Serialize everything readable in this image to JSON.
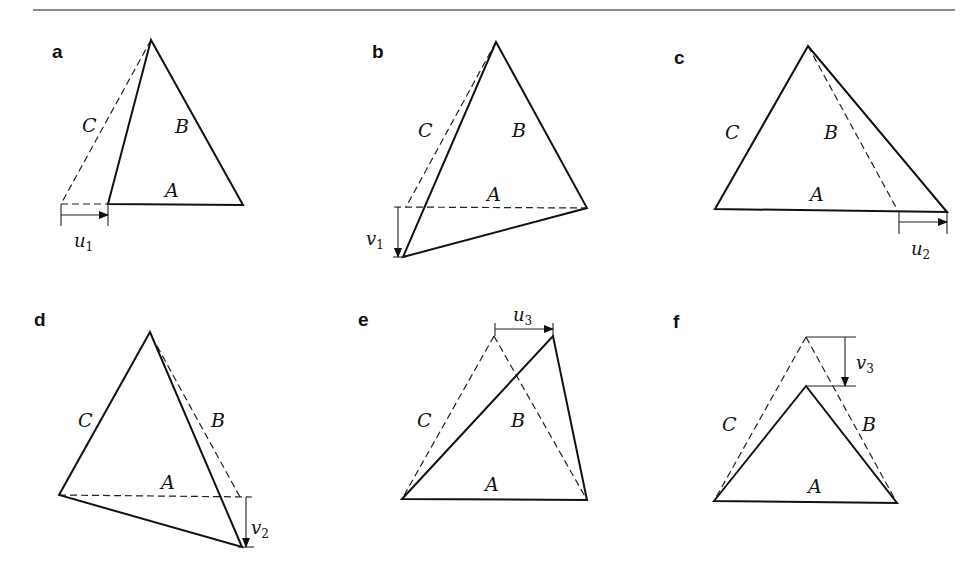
{
  "figure": {
    "rule_color": "#8a8a8a",
    "line_color": "#111111"
  },
  "panels": [
    {
      "id": "a",
      "letter": "a",
      "letter_pos": [
        52,
        58
      ],
      "solid": [
        [
          151,
          40
        ],
        [
          108,
          204
        ],
        [
          243,
          205
        ]
      ],
      "dashed": [
        [
          [
            151,
            40
          ],
          [
            61,
            204
          ]
        ],
        [
          [
            61,
            204
          ],
          [
            108,
            204
          ]
        ]
      ],
      "labels": [
        {
          "text": "C",
          "x": 82,
          "y": 132
        },
        {
          "text": "B",
          "x": 175,
          "y": 133
        },
        {
          "text": "A",
          "x": 165,
          "y": 197
        }
      ],
      "displacement": {
        "name": "u",
        "sub": "1",
        "direction": "horizontal",
        "from": [
          61,
          215
        ],
        "to": [
          108,
          215
        ],
        "ticks": [
          [
            61,
            204,
            61,
            226
          ],
          [
            108,
            204,
            108,
            226
          ]
        ],
        "label_x": 74,
        "label_y": 247
      }
    },
    {
      "id": "b",
      "letter": "b",
      "letter_pos": [
        372,
        58
      ],
      "solid": [
        [
          496,
          42
        ],
        [
          403,
          257
        ],
        [
          587,
          208
        ]
      ],
      "dashed": [
        [
          [
            496,
            42
          ],
          [
            406,
            207
          ]
        ],
        [
          [
            394,
            207
          ],
          [
            587,
            208
          ]
        ]
      ],
      "labels": [
        {
          "text": "C",
          "x": 418,
          "y": 137
        },
        {
          "text": "B",
          "x": 512,
          "y": 137
        },
        {
          "text": "A",
          "x": 487,
          "y": 201
        }
      ],
      "displacement": {
        "name": "v",
        "sub": "1",
        "direction": "vertical",
        "from": [
          398,
          207
        ],
        "to": [
          398,
          257
        ],
        "ticks": [
          [
            393,
            257,
            406,
            257
          ]
        ],
        "label_x": 366,
        "label_y": 245
      }
    },
    {
      "id": "c",
      "letter": "c",
      "letter_pos": [
        674,
        64
      ],
      "solid": [
        [
          808,
          46
        ],
        [
          715,
          209
        ],
        [
          947,
          212
        ]
      ],
      "dashed": [
        [
          [
            808,
            46
          ],
          [
            898,
            211
          ]
        ]
      ],
      "labels": [
        {
          "text": "C",
          "x": 725,
          "y": 139
        },
        {
          "text": "B",
          "x": 824,
          "y": 139
        },
        {
          "text": "A",
          "x": 810,
          "y": 201
        }
      ],
      "displacement": {
        "name": "u",
        "sub": "2",
        "direction": "horizontal",
        "from": [
          899,
          222
        ],
        "to": [
          947,
          222
        ],
        "ticks": [
          [
            899,
            211,
            899,
            234
          ],
          [
            947,
            212,
            947,
            234
          ]
        ],
        "label_x": 911,
        "label_y": 255
      }
    },
    {
      "id": "d",
      "letter": "d",
      "letter_pos": [
        34,
        326
      ],
      "solid": [
        [
          150,
          332
        ],
        [
          59,
          495
        ],
        [
          242,
          547
        ]
      ],
      "dashed": [
        [
          [
            157,
            346
          ],
          [
            240,
            497
          ]
        ],
        [
          [
            59,
            495
          ],
          [
            252,
            497
          ]
        ]
      ],
      "labels": [
        {
          "text": "C",
          "x": 78,
          "y": 427
        },
        {
          "text": "B",
          "x": 211,
          "y": 427
        },
        {
          "text": "A",
          "x": 161,
          "y": 489
        }
      ],
      "displacement": {
        "name": "v",
        "sub": "2",
        "direction": "vertical",
        "from": [
          246,
          497
        ],
        "to": [
          246,
          547
        ],
        "ticks": [
          [
            238,
            547,
            254,
            547
          ]
        ],
        "label_x": 251,
        "label_y": 534
      }
    },
    {
      "id": "e",
      "letter": "e",
      "letter_pos": [
        358,
        326
      ],
      "solid": [
        [
          402,
          499
        ],
        [
          553,
          336
        ],
        [
          587,
          500
        ]
      ],
      "dashed": [
        [
          [
            494,
            336
          ],
          [
            402,
            499
          ]
        ],
        [
          [
            494,
            336
          ],
          [
            587,
            500
          ]
        ]
      ],
      "labels": [
        {
          "text": "C",
          "x": 417,
          "y": 427
        },
        {
          "text": "B",
          "x": 511,
          "y": 427
        },
        {
          "text": "A",
          "x": 485,
          "y": 491
        }
      ],
      "displacement": {
        "name": "u",
        "sub": "3",
        "direction": "horizontal",
        "from": [
          495,
          329
        ],
        "to": [
          553,
          329
        ],
        "ticks": [
          [
            495,
            323,
            495,
            336
          ],
          [
            553,
            323,
            553,
            336
          ]
        ],
        "label_x": 513,
        "label_y": 321
      }
    },
    {
      "id": "f",
      "letter": "f",
      "letter_pos": [
        673,
        328
      ],
      "solid": [
        [
          714,
          501
        ],
        [
          806,
          386
        ],
        [
          897,
          503
        ]
      ],
      "dashed": [
        [
          [
            806,
            337
          ],
          [
            714,
            501
          ]
        ],
        [
          [
            806,
            337
          ],
          [
            897,
            503
          ]
        ]
      ],
      "labels": [
        {
          "text": "C",
          "x": 722,
          "y": 431
        },
        {
          "text": "B",
          "x": 862,
          "y": 431
        },
        {
          "text": "A",
          "x": 808,
          "y": 493
        }
      ],
      "displacement": {
        "name": "v",
        "sub": "3",
        "direction": "vertical",
        "from": [
          845,
          337
        ],
        "to": [
          845,
          386
        ],
        "ticks": [
          [
            806,
            337,
            856,
            337
          ],
          [
            806,
            386,
            856,
            386
          ]
        ],
        "label_x": 856,
        "label_y": 369
      }
    }
  ]
}
